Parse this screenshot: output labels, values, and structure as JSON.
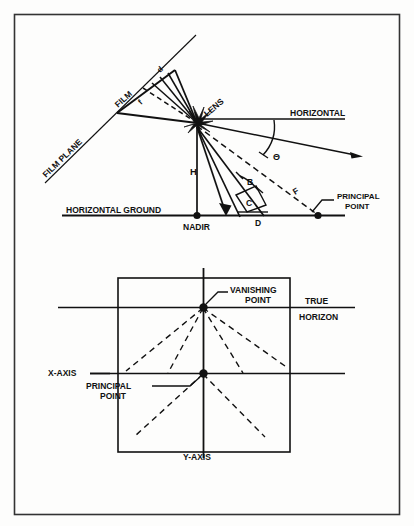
{
  "figure": {
    "border_color": "#222222",
    "line_color": "#111111",
    "background": "#fdfdfc"
  },
  "upper_diagram": {
    "name": "tilted-photo-geometry",
    "labels": {
      "film_plane": "FILM PLANE",
      "film": "FILM",
      "lens": "LENS",
      "horizontal": "HORIZONTAL",
      "horizontal_ground": "HORIZONTAL GROUND",
      "nadir": "NADIR",
      "principal_point": "PRINCIPAL\nPOINT",
      "principal_point_line1": "PRINCIPAL",
      "principal_point_line2": "POINT",
      "height": "H",
      "angle_theta": "Θ",
      "angle_b": "B",
      "angle_c": "C",
      "distance_d": "D",
      "distance_f": "F",
      "film_angle_d": "d",
      "film_angle_f": "f"
    }
  },
  "lower_diagram": {
    "name": "vanishing-point-construction",
    "labels": {
      "vanishing_point_line1": "VANISHING",
      "vanishing_point_line2": "POINT",
      "true": "TRUE",
      "horizon": "HORIZON",
      "x_axis": "X-AXIS",
      "y_axis": "Y-AXIS",
      "principal_point_line1": "PRINCIPAL",
      "principal_point_line2": "POINT"
    }
  }
}
